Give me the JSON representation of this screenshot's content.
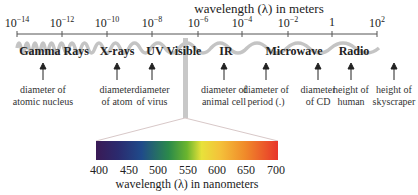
{
  "title": "wavelength (λ) in meters",
  "axis": {
    "ticks": [
      {
        "base": "10",
        "exp": "−14",
        "x": 17
      },
      {
        "base": "10",
        "exp": "−12",
        "x": 62
      },
      {
        "base": "10",
        "exp": "−10",
        "x": 107
      },
      {
        "base": "10",
        "exp": "−8",
        "x": 152
      },
      {
        "base": "10",
        "exp": "−6",
        "x": 198
      },
      {
        "base": "10",
        "exp": "−4",
        "x": 242
      },
      {
        "base": "10",
        "exp": "−2",
        "x": 288
      },
      {
        "base": "1",
        "exp": "",
        "x": 332
      },
      {
        "base": "10",
        "exp": "2",
        "x": 377
      }
    ]
  },
  "bands": [
    {
      "label": "Gamma Rays",
      "x": 54
    },
    {
      "label": "X-rays",
      "x": 117
    },
    {
      "label": "UV",
      "x": 155
    },
    {
      "label": "Visible",
      "x": 184
    },
    {
      "label": "IR",
      "x": 226
    },
    {
      "label": "Microwave",
      "x": 294
    },
    {
      "label": "Radio",
      "x": 354
    }
  ],
  "descriptions": [
    {
      "line1": "diameter of",
      "line2": "atomic nucleus",
      "x": 43
    },
    {
      "line1": "diameter",
      "line2": "of atom",
      "x": 117
    },
    {
      "line1": "diameter",
      "line2": "of virus",
      "x": 152
    },
    {
      "line1": "diameter of",
      "line2": "animal cell",
      "x": 226
    },
    {
      "line1": "diameter of",
      "line2": "period (.)",
      "x": 266
    },
    {
      "line1": "diameter",
      "line2": "of CD",
      "x": 318
    },
    {
      "line1": "height of",
      "line2": "human",
      "x": 351
    },
    {
      "line1": "height of",
      "line2": "skyscraper",
      "x": 393
    }
  ],
  "visible_spectrum": {
    "ticks": [
      "400",
      "450",
      "500",
      "550",
      "600",
      "650",
      "700"
    ],
    "title": "wavelength (λ) in nanometers",
    "colors": {
      "violet": "#3a1a55",
      "blue": "#1f4a8a",
      "green": "#6bb52e",
      "yellow": "#e8e23a",
      "orange": "#f08a2a",
      "red": "#e8352a"
    }
  },
  "colors": {
    "wave": "#c8c8c8",
    "axis": "#555555",
    "text": "#222222"
  }
}
